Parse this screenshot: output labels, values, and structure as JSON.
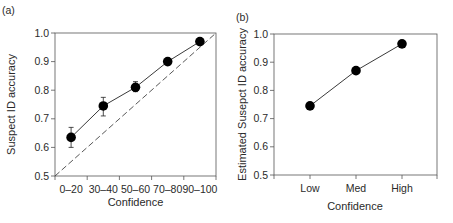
{
  "chart_data": [
    {
      "panel_label": "(a)",
      "type": "line",
      "title": "",
      "xlabel": "Confidence",
      "ylabel": "Suspect ID accuracy",
      "categories": [
        "0–20",
        "30–40",
        "50–60",
        "70–80",
        "90–100"
      ],
      "series": [
        {
          "name": "Suspect ID accuracy",
          "values": [
            0.635,
            0.745,
            0.81,
            0.9,
            0.97
          ],
          "error_low": [
            0.6,
            0.71,
            0.795,
            0.895,
            0.965
          ],
          "error_high": [
            0.67,
            0.775,
            0.83,
            0.905,
            0.975
          ]
        },
        {
          "name": "Perfect calibration (dashed diagonal)",
          "line_from": [
            0.5,
            0.5
          ],
          "line_to": [
            1.0,
            1.0
          ],
          "style": "dashed"
        }
      ],
      "ylim": [
        0.5,
        1.0
      ],
      "yticks": [
        "0.5",
        "0.6",
        "0.7",
        "0.8",
        "0.9",
        "1.0"
      ],
      "grid": false,
      "legend": "none"
    },
    {
      "panel_label": "(b)",
      "type": "line",
      "title": "",
      "xlabel": "Confidence",
      "ylabel": "Estimated Susepct ID accuracy",
      "categories": [
        "Low",
        "Med",
        "High"
      ],
      "series": [
        {
          "name": "Estimated suspect ID accuracy",
          "values": [
            0.745,
            0.87,
            0.965
          ]
        }
      ],
      "ylim": [
        0.5,
        1.0
      ],
      "yticks": [
        "0.5",
        "0.6",
        "0.7",
        "0.8",
        "0.9",
        "1.0"
      ],
      "grid": false,
      "legend": "none"
    }
  ],
  "panels": {
    "a": {
      "label": "(a)",
      "xlabel": "Confidence",
      "ylabel": "Suspect ID accuracy",
      "yticks": [
        "0.5",
        "0.6",
        "0.7",
        "0.8",
        "0.9",
        "1.0"
      ],
      "xticks": [
        "0–20",
        "30–40",
        "50–60",
        "70–80",
        "90–100"
      ]
    },
    "b": {
      "label": "(b)",
      "xlabel": "Confidence",
      "ylabel": "Estimated Susepct ID accuracy",
      "yticks": [
        "0.5",
        "0.6",
        "0.7",
        "0.8",
        "0.9",
        "1.0"
      ],
      "xticks": [
        "Low",
        "Med",
        "High"
      ]
    }
  },
  "colors": {
    "marker": "#000000",
    "line": "#3a3a3a",
    "axis": "#555555",
    "text": "#2a2a2a"
  }
}
